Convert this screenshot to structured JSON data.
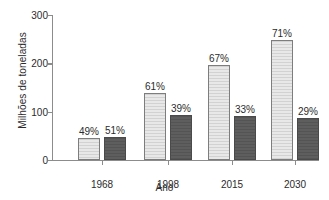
{
  "chart_data": {
    "type": "bar",
    "title": "",
    "xlabel": "Ano",
    "ylabel": "Milhões de toneladas",
    "categories": [
      "1968",
      "1998",
      "2015",
      "2030"
    ],
    "ylim": [
      0,
      300
    ],
    "yticks": [
      "0",
      "100",
      "200",
      "300"
    ],
    "grid": false,
    "legend": "none",
    "series": [
      {
        "name": "serie-clara",
        "style": "light-hatched",
        "color": "#dcdcdc",
        "values": [
          45,
          138,
          196,
          248
        ],
        "labels": [
          "49%",
          "61%",
          "67%",
          "71%"
        ]
      },
      {
        "name": "serie-escura",
        "style": "dark-solid",
        "color": "#595959",
        "values": [
          47,
          94,
          92,
          86
        ],
        "labels": [
          "51%",
          "39%",
          "33%",
          "29%"
        ]
      }
    ]
  }
}
